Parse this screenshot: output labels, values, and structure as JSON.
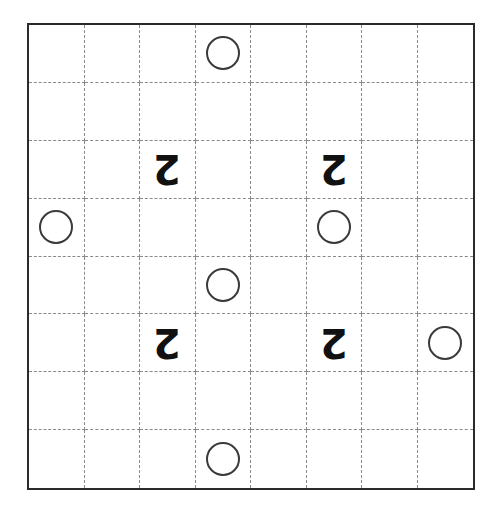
{
  "puzzle": {
    "rows": 8,
    "cols": 8,
    "colors": {
      "border": "#2a2a2a",
      "gridline": "#8a8a8a",
      "circle": "#3a3a3a",
      "number": "#111111"
    },
    "circles": [
      {
        "row": 0,
        "col": 3
      },
      {
        "row": 3,
        "col": 0
      },
      {
        "row": 3,
        "col": 5
      },
      {
        "row": 4,
        "col": 3
      },
      {
        "row": 5,
        "col": 7
      },
      {
        "row": 7,
        "col": 3
      }
    ],
    "numbers": [
      {
        "row": 2,
        "col": 2,
        "value": "2",
        "rotated": true
      },
      {
        "row": 2,
        "col": 5,
        "value": "2",
        "rotated": true
      },
      {
        "row": 5,
        "col": 2,
        "value": "2",
        "rotated": true
      },
      {
        "row": 5,
        "col": 5,
        "value": "2",
        "rotated": true
      }
    ]
  }
}
